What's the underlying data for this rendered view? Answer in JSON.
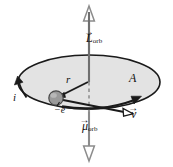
{
  "figure": {
    "background_color": "#ffffff",
    "labels": {
      "angular_momentum": {
        "symbol": "L",
        "subscript": "orb",
        "vector": true,
        "arrow_glyph": "→"
      },
      "magnetic_moment": {
        "symbol": "μ",
        "subscript": "orb",
        "vector": true,
        "arrow_glyph": "→"
      },
      "area": {
        "symbol": "A",
        "vector": false
      },
      "radius": {
        "symbol": "r",
        "vector": false
      },
      "current": {
        "symbol": "i",
        "vector": false
      },
      "charge": {
        "symbol": "−e",
        "vector": false
      },
      "velocity": {
        "symbol": "v",
        "vector": true,
        "arrow_glyph": "→"
      }
    },
    "colors": {
      "axis_line": "#8c8c8c",
      "orbit_stroke": "#1a1a1a",
      "orbit_fill": "#e3e3e3",
      "electron_fill": "#9a9a9a",
      "electron_stroke": "#4a4a4a",
      "vector_stroke": "#1a1a1a",
      "arrowhead_fill": "#ffffff",
      "dashed_line": "#9a9a9a",
      "text": "#111111"
    },
    "geometry": {
      "orbit_center": {
        "x": 89,
        "y": 82
      },
      "orbit_radius_x": 71,
      "orbit_radius_y": 27,
      "axis_x": 89,
      "axis_top_y": 6,
      "axis_bottom_y": 161,
      "electron": {
        "x": 56,
        "y": 98,
        "r": 7
      }
    }
  }
}
